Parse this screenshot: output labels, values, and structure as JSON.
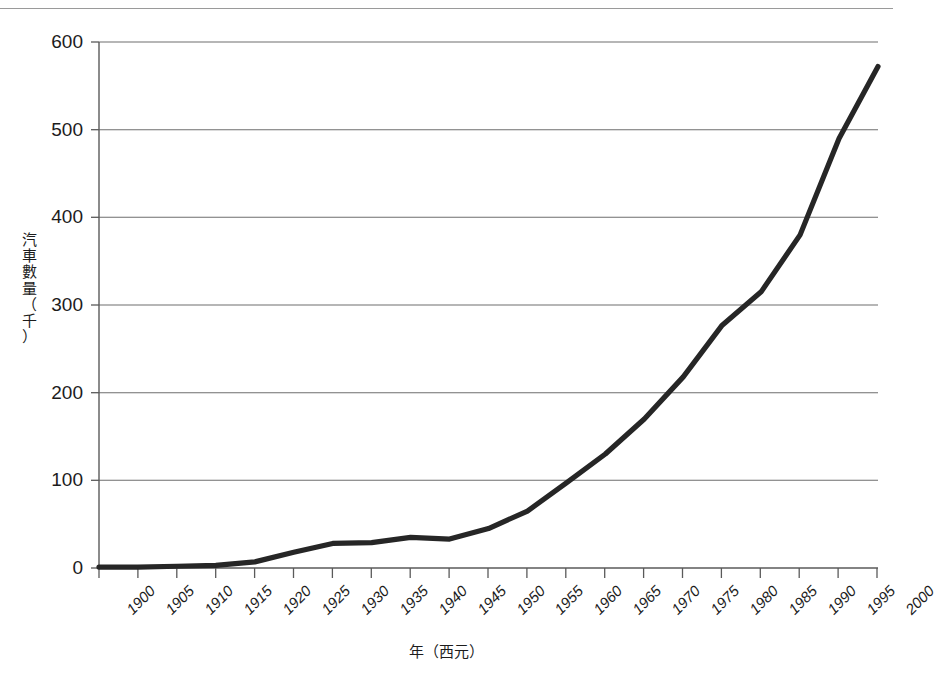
{
  "chart_data": {
    "type": "line",
    "title": "",
    "subtitle": "",
    "xlabel": "年（西元）",
    "ylabel": "汽車數量（千）",
    "ylabel_chars": [
      "汽",
      "車",
      "數",
      "量",
      "（",
      "千",
      "）"
    ],
    "x": [
      1900,
      1905,
      1910,
      1915,
      1920,
      1925,
      1930,
      1935,
      1940,
      1945,
      1950,
      1955,
      1960,
      1965,
      1970,
      1975,
      1980,
      1985,
      1990,
      1995,
      2000
    ],
    "values": [
      1,
      1,
      2,
      3,
      7,
      18,
      28,
      29,
      35,
      33,
      45,
      65,
      97,
      130,
      170,
      218,
      277,
      315,
      380,
      490,
      572
    ],
    "categories": [
      "1900",
      "1905",
      "1910",
      "1915",
      "1920",
      "1925",
      "1930",
      "1935",
      "1940",
      "1945",
      "1950",
      "1955",
      "1960",
      "1965",
      "1970",
      "1975",
      "1980",
      "1985",
      "1990",
      "1995",
      "2000"
    ],
    "xtick_labels": [
      "1900",
      "1905",
      "1910",
      "1915",
      "1920",
      "1925",
      "1930",
      "1935",
      "1940",
      "1945",
      "1950",
      "1955",
      "1960",
      "1965",
      "1970",
      "1975",
      "1980",
      "1985",
      "1990",
      "1995",
      "2000"
    ],
    "ytick_labels": [
      "0",
      "100",
      "200",
      "300",
      "400",
      "500",
      "600"
    ],
    "ytick_values": [
      0,
      100,
      200,
      300,
      400,
      500,
      600
    ],
    "xlim": [
      1900,
      2000
    ],
    "ylim": [
      0,
      600
    ],
    "grid": "horizontal",
    "legend": "none",
    "series_color": "#262626",
    "grid_color": "#6e6e6e",
    "axis_color": "#5a5a5a",
    "background_color": "#ffffff",
    "annotations": []
  }
}
